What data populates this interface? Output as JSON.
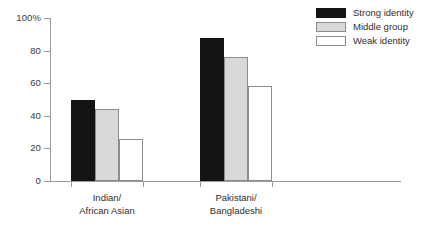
{
  "chart_data": {
    "type": "bar",
    "title": "",
    "subtitle": "",
    "xlabel": "",
    "ylabel": "",
    "ylim": [
      0,
      100
    ],
    "y_unit": "%",
    "grid": false,
    "legend_position": "top-right",
    "categories": [
      "Indian/\nAfrican Asian",
      "Pakistani/\nBangladeshi"
    ],
    "category_lines": [
      [
        "Indian/",
        "African Asian"
      ],
      [
        "Pakistani/",
        "Bangladeshi"
      ]
    ],
    "y_ticks": [
      {
        "value": 100,
        "label": "100%"
      },
      {
        "value": 80,
        "label": "80"
      },
      {
        "value": 60,
        "label": "60"
      },
      {
        "value": 40,
        "label": "40"
      },
      {
        "value": 20,
        "label": "20"
      },
      {
        "value": 0,
        "label": "0"
      }
    ],
    "series": [
      {
        "name": "Strong identity",
        "color": "#141414",
        "values": [
          50,
          88
        ]
      },
      {
        "name": "Middle group",
        "color": "#d9d9d9",
        "values": [
          44,
          76
        ]
      },
      {
        "name": "Weak identity",
        "color": "#ffffff",
        "values": [
          26,
          58
        ]
      }
    ]
  },
  "legend": {
    "items": [
      {
        "label": "Strong identity",
        "swatch": "strong"
      },
      {
        "label": "Middle group",
        "swatch": "middle"
      },
      {
        "label": "Weak identity",
        "swatch": "weak"
      }
    ]
  },
  "axis": {
    "y_axis_name": "percent-axis",
    "x_axis_name": "category-axis"
  }
}
